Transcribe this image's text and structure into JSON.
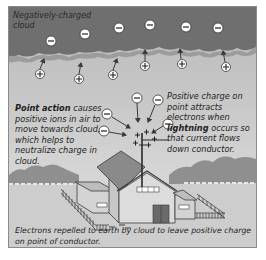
{
  "diagram": {
    "labels": {
      "cloud": "Negatively-charged cloud",
      "point_action_bold": "Point action",
      "point_action_rest": " causes positive ions in air to move towards cloud, which helps to neutralize charge in cloud.",
      "positive_charge_pre": "Positive charge on point attracts electrons when ",
      "positive_charge_bold": "lightning",
      "positive_charge_post": " occurs so that current flows down conductor.",
      "electrons_repelled": "Electrons repelled to earth by cloud to leave positive charge on point of conductor."
    },
    "symbols": {
      "negative": "−",
      "positive": "+"
    },
    "cloud_charges": {
      "negative_count": 6,
      "positive_ion_count": 6
    },
    "near_rod_charges": {
      "negative_count": 5,
      "positive_on_point_count": 5
    },
    "colors": {
      "cloud": "#6e6e6e",
      "cloud_edge": "#9a9a9a",
      "sky": "#c8c8c8",
      "ground": "#cdcdcd",
      "house_wall": "#d9d9d9",
      "roof": "#8c8c8c",
      "door": "#6a6a6a",
      "outline": "#3a3a3a",
      "text": "#1e1e1e"
    }
  }
}
